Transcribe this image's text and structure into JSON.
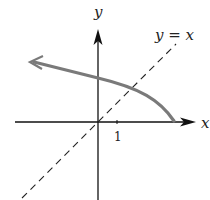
{
  "diagram": {
    "x_axis_label": "x",
    "y_axis_label": "y",
    "line_label": "y = x",
    "tick_label": "1",
    "colors": {
      "axes": "#111111",
      "curve": "#7a7a7a",
      "dashed_line": "#222222",
      "background": "#ffffff"
    }
  }
}
